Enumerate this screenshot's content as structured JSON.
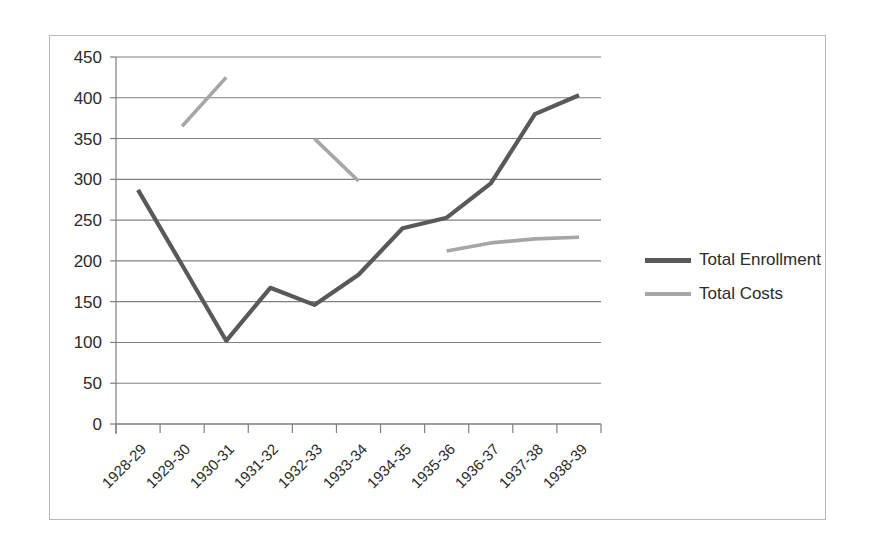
{
  "chart_data": {
    "type": "line",
    "title": "",
    "xlabel": "",
    "ylabel": "",
    "ylim": [
      0,
      450
    ],
    "ytick_step": 50,
    "yticks": [
      "450",
      "400",
      "350",
      "300",
      "250",
      "200",
      "150",
      "100",
      "50",
      "0"
    ],
    "grid": true,
    "legend_position": "right",
    "categories": [
      "1928-29",
      "1929-30",
      "1930-31",
      "1931-32",
      "1932-33",
      "1933-34",
      "1934-35",
      "1935-36",
      "1936-37",
      "1937-38",
      "1938-39"
    ],
    "series": [
      {
        "name": "Total Enrollment",
        "color": "#595959",
        "values": [
          287,
          195,
          102,
          167,
          146,
          183,
          240,
          253,
          295,
          380,
          403
        ]
      },
      {
        "name": "Total Costs",
        "color": "#a6a6a6",
        "values": [
          null,
          365,
          425,
          null,
          350,
          298,
          null,
          212,
          222,
          227,
          229
        ]
      }
    ]
  },
  "legend": {
    "items": [
      {
        "label": "Total Enrollment",
        "color": "#595959"
      },
      {
        "label": "Total Costs",
        "color": "#a6a6a6"
      }
    ]
  },
  "colors": {
    "enrollment_line": "#595959",
    "costs_line": "#a6a6a6",
    "gridline": "#808080",
    "axis": "#7f7f7f",
    "frame_border": "#b8b8b8",
    "text": "#2b2b2b",
    "background": "#ffffff"
  }
}
